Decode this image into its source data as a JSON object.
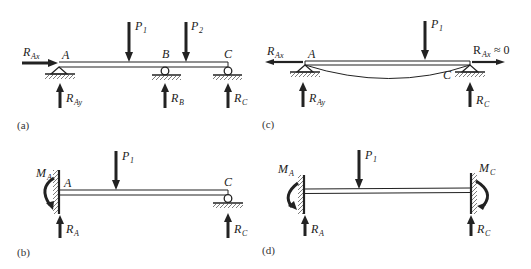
{
  "figure": {
    "panels": [
      {
        "id": "a",
        "caption": "(a)",
        "description": "Continuous beam on pin support A and roller supports B and C with two point loads",
        "points": [
          "A",
          "B",
          "C"
        ],
        "supports": [
          {
            "point": "A",
            "type": "pin"
          },
          {
            "point": "B",
            "type": "roller"
          },
          {
            "point": "C",
            "type": "roller"
          }
        ],
        "loads": [
          {
            "name": "P",
            "sub": "1",
            "direction": "down"
          },
          {
            "name": "P",
            "sub": "2",
            "direction": "down"
          }
        ],
        "reactions": [
          {
            "name": "R",
            "sub": "Ax",
            "direction": "right"
          },
          {
            "name": "R",
            "sub": "Ay",
            "direction": "up"
          },
          {
            "name": "R",
            "sub": "B",
            "direction": "up"
          },
          {
            "name": "R",
            "sub": "C",
            "direction": "up"
          }
        ]
      },
      {
        "id": "b",
        "caption": "(b)",
        "description": "Propped cantilever: fixed at A, roller at C, one point load",
        "points": [
          "A",
          "C"
        ],
        "supports": [
          {
            "point": "A",
            "type": "fixed"
          },
          {
            "point": "C",
            "type": "roller"
          }
        ],
        "loads": [
          {
            "name": "P",
            "sub": "1",
            "direction": "down"
          }
        ],
        "reactions": [
          {
            "name": "M",
            "sub": "A",
            "direction": "counterclockwise"
          },
          {
            "name": "R",
            "sub": "A",
            "direction": "up"
          },
          {
            "name": "R",
            "sub": "C",
            "direction": "up"
          }
        ]
      },
      {
        "id": "c",
        "caption": "(c)",
        "description": "Beam pinned at both ends A and C showing deflected shape and axial reactions",
        "points": [
          "A",
          "C"
        ],
        "supports": [
          {
            "point": "A",
            "type": "pin"
          },
          {
            "point": "C",
            "type": "pin"
          }
        ],
        "loads": [
          {
            "name": "P",
            "sub": "1",
            "direction": "down"
          }
        ],
        "reactions": [
          {
            "name": "R",
            "sub": "Ax",
            "direction": "left"
          },
          {
            "name": "R",
            "sub": "Ay",
            "direction": "up"
          },
          {
            "name": "R",
            "sub": "C",
            "direction": "up"
          },
          {
            "name": "R",
            "sub": "Ax",
            "direction": "right",
            "note": "≈ 0"
          }
        ]
      },
      {
        "id": "d",
        "caption": "(d)",
        "description": "Fixed-fixed beam with one point load",
        "points": [],
        "supports": [
          {
            "point": "A",
            "type": "fixed"
          },
          {
            "point": "C",
            "type": "fixed"
          }
        ],
        "loads": [
          {
            "name": "P",
            "sub": "1",
            "direction": "down"
          }
        ],
        "reactions": [
          {
            "name": "M",
            "sub": "A",
            "direction": "clockwise"
          },
          {
            "name": "R",
            "sub": "A",
            "direction": "up"
          },
          {
            "name": "M",
            "sub": "C",
            "direction": "counterclockwise"
          },
          {
            "name": "R",
            "sub": "C",
            "direction": "up"
          }
        ]
      }
    ],
    "colors": {
      "ink": "#222222",
      "caption": "#333333",
      "background": "#ffffff"
    }
  }
}
